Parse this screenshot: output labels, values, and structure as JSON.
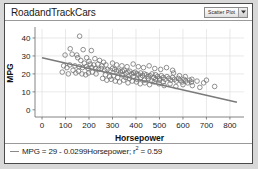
{
  "window": {
    "title": "RoadandTrackCars",
    "plot_type_selector": {
      "selected": "Scatter Plot",
      "arrow_icon": "chevron-down-icon",
      "options": [
        "Scatter Plot"
      ]
    }
  },
  "legend": {
    "marker_icon": "line-swatch-icon",
    "equation_prefix": "MPG = 29 - 0.0299Horsepower; ",
    "r2_symbol": "r",
    "r2_exponent": "2",
    "r2_value": " = 0.59",
    "full_text": "MPG = 29 - 0.0299Horsepower; r2 = 0.59"
  },
  "chart_data": {
    "type": "scatter",
    "title": "RoadandTrackCars",
    "xlabel": "Horsepower",
    "ylabel": "MPG",
    "xlim": [
      -30,
      860
    ],
    "ylim": [
      -4,
      45
    ],
    "xticks": [
      0,
      100,
      200,
      300,
      400,
      500,
      600,
      700,
      800
    ],
    "yticks": [
      0,
      10,
      20,
      30,
      40
    ],
    "grid": true,
    "grid_color": "#e0e0e0",
    "marker_color": "#6e6e6e",
    "marker_fill": "#ffffff",
    "marker_size": 2.3,
    "legend_position": "bottom-left",
    "fit_line": {
      "intercept": 29,
      "slope": -0.0299,
      "r_squared": 0.59,
      "color": "#7a7a7a",
      "x_start": 0,
      "x_end": 830
    },
    "points": [
      [
        160,
        41.0
      ],
      [
        120,
        34.0
      ],
      [
        175,
        33.5
      ],
      [
        210,
        33.0
      ],
      [
        98,
        30.5
      ],
      [
        128,
        31.0
      ],
      [
        148,
        30.5
      ],
      [
        152,
        29.0
      ],
      [
        190,
        29.0
      ],
      [
        225,
        28.5
      ],
      [
        165,
        27.5
      ],
      [
        200,
        27.0
      ],
      [
        245,
        27.5
      ],
      [
        262,
        26.5
      ],
      [
        180,
        26.0
      ],
      [
        205,
        25.5
      ],
      [
        220,
        25.0
      ],
      [
        238,
        25.5
      ],
      [
        255,
        24.5
      ],
      [
        272,
        25.0
      ],
      [
        118,
        25.0
      ],
      [
        140,
        24.5
      ],
      [
        158,
        24.0
      ],
      [
        172,
        23.5
      ],
      [
        188,
        24.0
      ],
      [
        196,
        23.0
      ],
      [
        212,
        23.5
      ],
      [
        228,
        23.0
      ],
      [
        240,
        22.5
      ],
      [
        252,
        23.0
      ],
      [
        266,
        22.0
      ],
      [
        278,
        22.5
      ],
      [
        290,
        22.0
      ],
      [
        300,
        23.0
      ],
      [
        310,
        22.5
      ],
      [
        318,
        21.5
      ],
      [
        325,
        22.0
      ],
      [
        334,
        21.0
      ],
      [
        342,
        21.5
      ],
      [
        350,
        22.0
      ],
      [
        358,
        20.5
      ],
      [
        366,
        21.0
      ],
      [
        374,
        21.5
      ],
      [
        382,
        20.0
      ],
      [
        390,
        20.5
      ],
      [
        396,
        21.0
      ],
      [
        404,
        20.0
      ],
      [
        412,
        19.5
      ],
      [
        420,
        20.5
      ],
      [
        428,
        19.0
      ],
      [
        436,
        20.0
      ],
      [
        444,
        19.5
      ],
      [
        452,
        18.5
      ],
      [
        460,
        19.0
      ],
      [
        468,
        20.0
      ],
      [
        476,
        18.0
      ],
      [
        484,
        19.5
      ],
      [
        492,
        18.5
      ],
      [
        500,
        17.5
      ],
      [
        508,
        19.0
      ],
      [
        516,
        18.0
      ],
      [
        524,
        17.0
      ],
      [
        532,
        18.5
      ],
      [
        540,
        17.5
      ],
      [
        548,
        16.5
      ],
      [
        556,
        18.0
      ],
      [
        564,
        17.0
      ],
      [
        572,
        16.0
      ],
      [
        580,
        17.5
      ],
      [
        588,
        16.5
      ],
      [
        596,
        15.5
      ],
      [
        604,
        17.0
      ],
      [
        612,
        16.0
      ],
      [
        620,
        15.0
      ],
      [
        628,
        16.5
      ],
      [
        636,
        15.5
      ],
      [
        300,
        26.0
      ],
      [
        318,
        25.0
      ],
      [
        340,
        24.5
      ],
      [
        362,
        24.0
      ],
      [
        388,
        25.5
      ],
      [
        410,
        24.0
      ],
      [
        432,
        23.5
      ],
      [
        456,
        24.5
      ],
      [
        480,
        23.0
      ],
      [
        505,
        22.5
      ],
      [
        530,
        23.5
      ],
      [
        556,
        22.0
      ],
      [
        270,
        19.5
      ],
      [
        288,
        18.5
      ],
      [
        305,
        19.0
      ],
      [
        322,
        18.0
      ],
      [
        340,
        19.5
      ],
      [
        356,
        18.0
      ],
      [
        372,
        17.5
      ],
      [
        388,
        18.5
      ],
      [
        404,
        17.0
      ],
      [
        420,
        18.0
      ],
      [
        436,
        16.5
      ],
      [
        452,
        17.5
      ],
      [
        468,
        16.0
      ],
      [
        484,
        17.0
      ],
      [
        500,
        16.5
      ],
      [
        516,
        15.5
      ],
      [
        258,
        17.5
      ],
      [
        276,
        16.5
      ],
      [
        294,
        17.0
      ],
      [
        312,
        16.0
      ],
      [
        330,
        15.5
      ],
      [
        348,
        16.5
      ],
      [
        366,
        15.0
      ],
      [
        384,
        16.0
      ],
      [
        402,
        15.5
      ],
      [
        418,
        14.5
      ],
      [
        438,
        15.0
      ],
      [
        458,
        14.0
      ],
      [
        478,
        15.5
      ],
      [
        498,
        14.5
      ],
      [
        520,
        13.5
      ],
      [
        545,
        14.5
      ],
      [
        570,
        13.0
      ],
      [
        600,
        14.0
      ],
      [
        640,
        13.5
      ],
      [
        672,
        12.5
      ],
      [
        700,
        16.5
      ],
      [
        735,
        13.0
      ],
      [
        560,
        20.5
      ],
      [
        585,
        19.0
      ],
      [
        610,
        18.5
      ],
      [
        638,
        17.0
      ],
      [
        660,
        16.0
      ],
      [
        688,
        15.0
      ],
      [
        230,
        20.0
      ],
      [
        214,
        21.0
      ],
      [
        198,
        20.5
      ],
      [
        186,
        19.5
      ],
      [
        170,
        20.0
      ],
      [
        155,
        21.5
      ],
      [
        144,
        20.5
      ],
      [
        132,
        22.0
      ],
      [
        106,
        23.5
      ],
      [
        92,
        24.5
      ],
      [
        86,
        21.0
      ],
      [
        112,
        20.0
      ]
    ]
  }
}
